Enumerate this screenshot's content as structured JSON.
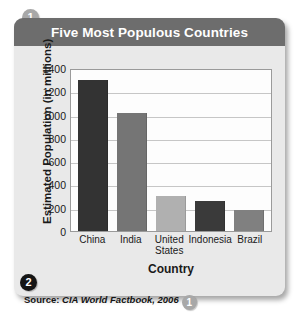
{
  "header": {
    "title": "Five Most Populous Countries"
  },
  "badges": {
    "callout_one": "1",
    "callout_two": "2",
    "callout_one_source": "1"
  },
  "source": {
    "label": "Source:",
    "text": "CIA World Factbook, 2006"
  },
  "colors": {
    "title_bar": "#6d6d6d",
    "panel": "#e9e9e9",
    "plot_bg": "#fdfdfd",
    "gridline": "#c6c6c6",
    "bar_china": "#333333",
    "bar_india": "#757575",
    "bar_united_states": "#b0b0b0",
    "bar_indonesia": "#3a3a3a",
    "bar_brazil": "#808080",
    "badge_gray": "#a8a8a8",
    "badge_black": "#151515"
  },
  "chart_data": {
    "type": "bar",
    "title": "Five Most Populous Countries",
    "xlabel": "Country",
    "ylabel": "Estimated Population (in millions)",
    "categories": [
      "China",
      "India",
      "United States",
      "Indonesia",
      "Brazil"
    ],
    "values": [
      1300,
      1010,
      300,
      260,
      180
    ],
    "bar_colors": [
      "#333333",
      "#757575",
      "#b0b0b0",
      "#3a3a3a",
      "#808080"
    ],
    "ylim": [
      0,
      1400
    ],
    "yticks": [
      0,
      200,
      400,
      600,
      800,
      1000,
      1200,
      1400
    ],
    "ytick_labels": [
      "0",
      "200",
      "400",
      "600",
      "800",
      "1000",
      "1200",
      "1400"
    ],
    "xtick_labels": [
      "China",
      "India",
      "United States",
      "Indonesia",
      "Brazil"
    ],
    "grid": true,
    "grid_axis": "y",
    "legend": false,
    "source_note": "Source: CIA World Factbook, 2006"
  }
}
